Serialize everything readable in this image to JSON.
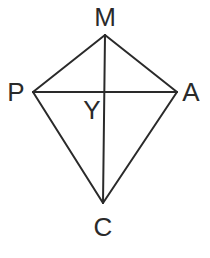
{
  "diagram": {
    "type": "kite",
    "colors": {
      "stroke": "#2a2a2a",
      "text": "#2a2a2a",
      "background": "#ffffff"
    },
    "vertices": [
      {
        "id": "M",
        "label": "M",
        "x": 105,
        "y": 35,
        "label_x": 105,
        "label_y": 26
      },
      {
        "id": "P",
        "label": "P",
        "x": 33,
        "y": 92,
        "label_x": 16,
        "label_y": 101
      },
      {
        "id": "A",
        "label": "A",
        "x": 177,
        "y": 92,
        "label_x": 191,
        "label_y": 101
      },
      {
        "id": "C",
        "label": "C",
        "x": 103,
        "y": 203,
        "label_x": 103,
        "label_y": 236
      }
    ],
    "intersection": {
      "id": "Y",
      "label": "Y",
      "x": 105,
      "y": 92,
      "label_x": 92,
      "label_y": 119
    },
    "edges": [
      {
        "from": "M",
        "to": "P"
      },
      {
        "from": "M",
        "to": "A"
      },
      {
        "from": "P",
        "to": "C"
      },
      {
        "from": "A",
        "to": "C"
      }
    ],
    "diagonals": [
      {
        "from": "M",
        "to": "C"
      },
      {
        "from": "P",
        "to": "A"
      }
    ]
  }
}
